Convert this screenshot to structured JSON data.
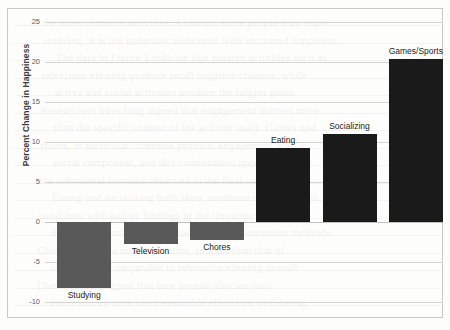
{
  "chart_data": {
    "type": "bar",
    "title": "",
    "xlabel": "",
    "ylabel": "Percent Change in Happiness",
    "categories": [
      "Studying",
      "Television",
      "Chores",
      "Eating",
      "Socializing",
      "Games/Sports"
    ],
    "values": [
      -8.3,
      -2.8,
      -2.3,
      9.2,
      11.0,
      20.4
    ],
    "ylim": [
      -10,
      25
    ],
    "yticks": [
      25,
      20,
      15,
      10,
      5,
      0,
      -5,
      -10
    ],
    "ytick_labels": [
      "25",
      "20",
      "15",
      "10",
      "5",
      "0",
      "-5",
      "-10"
    ],
    "grid": true,
    "legend": "none",
    "bar_colors": {
      "negative": "#595959",
      "positive": "#1a1a1a"
    },
    "label_placement": [
      "below-bar",
      "below-bar",
      "below-bar",
      "above-bar",
      "above-bar",
      "above-bar"
    ]
  },
  "background_bleed": {
    "lines": [
      "of the most common activities. Although some people may enjoy",
      "studying, it is not generally associated with increased happiness.",
      "The data in Figure 1 indicate that passive activities such as",
      "television viewing produce small negative changes, while",
      "active and social activities produce the largest gains.",
      "Researchers have long argued that engagement matters more",
      "than the specific content of the activity itself. Games and",
      "sports, in particular, combine physical engagement with a",
      "social component, and this combination appears to drive",
      "the substantial increase observed in the final category.",
      "Eating and socializing both show moderate improvements,",
      "consistent with earlier findings in the literature on",
      "daily mood sampling and experience reconstruction methods.",
      "Chores produce a modest decline, smaller than that of",
      "studying but comparable to television viewing overall.",
      "These results suggest that how people allocate their",
      "discretionary time has measurable effects on well-being."
    ]
  }
}
